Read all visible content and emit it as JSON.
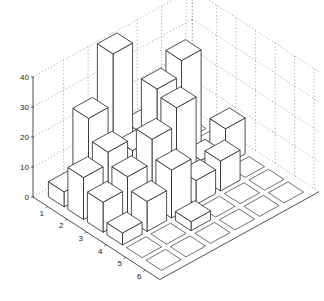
{
  "chart_data": {
    "type": "bar3d",
    "title": "",
    "xlabel": "",
    "ylabel": "",
    "zlabel": "",
    "row_ticks": [
      "1",
      "2",
      "3",
      "4",
      "5",
      "6"
    ],
    "z_ticks": [
      "0",
      "10",
      "20",
      "30",
      "40"
    ],
    "zlim": [
      0,
      40
    ],
    "grid": true,
    "values": [
      [
        5,
        25,
        42,
        12,
        8,
        0
      ],
      [
        14,
        18,
        14,
        30,
        35,
        0
      ],
      [
        10,
        14,
        22,
        28,
        6,
        12
      ],
      [
        4,
        10,
        16,
        8,
        10,
        0
      ],
      [
        0,
        0,
        3,
        0,
        0,
        0
      ],
      [
        0,
        0,
        0,
        0,
        0,
        0
      ]
    ]
  },
  "axes": {
    "z_tick_labels": [
      "0",
      "10",
      "20",
      "30",
      "40"
    ],
    "row_tick_labels": [
      "1",
      "2",
      "3",
      "4",
      "5",
      "6"
    ]
  }
}
